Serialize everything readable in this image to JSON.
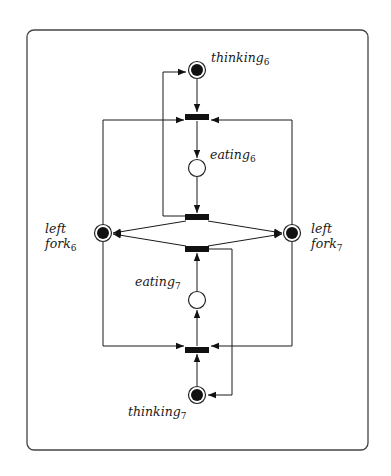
{
  "diagram": {
    "type": "petri-net",
    "places": [
      {
        "id": "thinking6",
        "label": "thinking",
        "subscript": "6",
        "marked": true
      },
      {
        "id": "eating6",
        "label": "eating",
        "subscript": "6",
        "marked": false
      },
      {
        "id": "leftfork6",
        "label": "left",
        "label2": "fork",
        "subscript": "6",
        "marked": true
      },
      {
        "id": "leftfork7",
        "label": "left",
        "label2": "fork",
        "subscript": "7",
        "marked": true
      },
      {
        "id": "eating7",
        "label": "eating",
        "subscript": "7",
        "marked": false
      },
      {
        "id": "thinking7",
        "label": "thinking",
        "subscript": "7",
        "marked": true
      }
    ],
    "transitions": [
      {
        "id": "take6"
      },
      {
        "id": "release6"
      },
      {
        "id": "release7"
      },
      {
        "id": "take7"
      }
    ],
    "arcs": [
      {
        "from": "thinking6",
        "to": "take6"
      },
      {
        "from": "leftfork6",
        "to": "take6"
      },
      {
        "from": "leftfork7",
        "to": "take6"
      },
      {
        "from": "take6",
        "to": "eating6"
      },
      {
        "from": "eating6",
        "to": "release6"
      },
      {
        "from": "release6",
        "to": "thinking6"
      },
      {
        "from": "release6",
        "to": "leftfork6"
      },
      {
        "from": "release6",
        "to": "leftfork7"
      },
      {
        "from": "thinking7",
        "to": "take7"
      },
      {
        "from": "leftfork6",
        "to": "take7"
      },
      {
        "from": "leftfork7",
        "to": "take7"
      },
      {
        "from": "take7",
        "to": "eating7"
      },
      {
        "from": "eating7",
        "to": "release7"
      },
      {
        "from": "release7",
        "to": "thinking7"
      },
      {
        "from": "release7",
        "to": "leftfork6"
      },
      {
        "from": "release7",
        "to": "leftfork7"
      }
    ]
  }
}
